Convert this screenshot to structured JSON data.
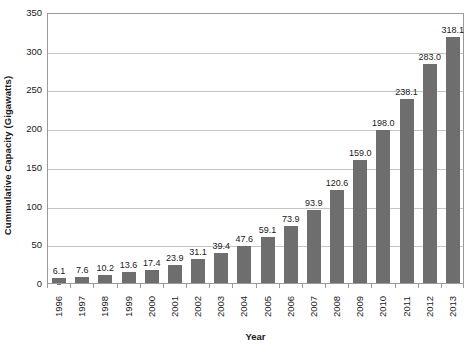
{
  "chart_data": {
    "type": "bar",
    "title": "",
    "subtitle": "",
    "xlabel": "Year",
    "ylabel": "Cummulative Capacity (Gigawatts)",
    "categories": [
      "1996",
      "1997",
      "1998",
      "1999",
      "2000",
      "2001",
      "2002",
      "2003",
      "2004",
      "2005",
      "2006",
      "2007",
      "2008",
      "2009",
      "2010",
      "2011",
      "2012",
      "2013"
    ],
    "values": [
      6.1,
      7.6,
      10.2,
      13.6,
      17.4,
      23.9,
      31.1,
      39.4,
      47.6,
      59.1,
      73.9,
      93.9,
      120.6,
      159.0,
      198.0,
      238.1,
      283.0,
      318.1
    ],
    "value_labels": [
      "6.1",
      "7.6",
      "10.2",
      "13.6",
      "17.4",
      "23.9",
      "31.1",
      "39.4",
      "47.6",
      "59.1",
      "73.9",
      "93.9",
      "120.6",
      "159.0",
      "198.0",
      "238.1",
      "283.0",
      "318.1"
    ],
    "ylim": [
      0,
      350
    ],
    "ytick_values": [
      0,
      50,
      100,
      150,
      200,
      250,
      300,
      350
    ],
    "ytick_labels": [
      "0",
      "50",
      "100",
      "150",
      "200",
      "250",
      "300",
      "350"
    ],
    "grid": true,
    "grid_axis": "y",
    "legend": false,
    "legend_position": "none",
    "bar_color": "#6e6e6e",
    "gridline_color": "#c4c4c4",
    "axis_color": "#9a9a9a",
    "background_color": "#ffffff",
    "text_color": "#1a1a1a",
    "data_labels_shown": true
  }
}
